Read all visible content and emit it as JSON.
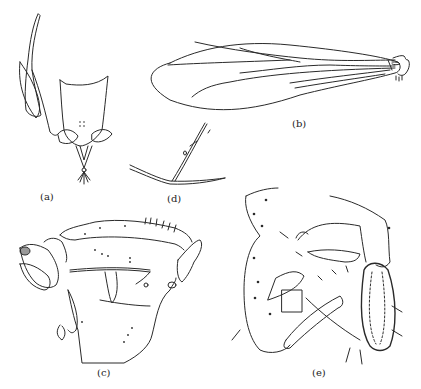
{
  "figure": {
    "panels": [
      {
        "id": "a",
        "label": "(a)",
        "subject": "male terminalia, ventral view"
      },
      {
        "id": "b",
        "label": "(b)",
        "subject": "wing"
      },
      {
        "id": "c",
        "label": "(c)",
        "subject": "thorax, lateral view"
      },
      {
        "id": "d",
        "label": "(d)",
        "subject": "wing vein detail"
      },
      {
        "id": "e",
        "label": "(e)",
        "subject": "hypopygium, lateral view"
      }
    ]
  }
}
